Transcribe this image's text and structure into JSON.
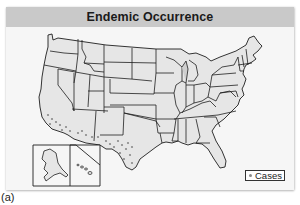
{
  "figure": {
    "title": "Endemic Occurrence",
    "caption": "(a)"
  },
  "legend": {
    "items": [
      {
        "symbol": "dot-icon",
        "label": "Cases",
        "color": "#8a8a8a"
      }
    ]
  },
  "map": {
    "region": "United States (contiguous, with Alaska and Hawaii insets)",
    "fill_color": "#e6e6e6",
    "border_color": "#1e1e1e",
    "case_dot_color": "#8a8a8a",
    "case_regions": [
      "California (southern)",
      "Arizona",
      "New Mexico",
      "Texas (western/southern)"
    ],
    "insets": [
      "Alaska",
      "Hawaii"
    ]
  },
  "colors": {
    "header_bg": "#c9c9c9",
    "panel_bg": "#f4f4f4",
    "text": "#1a1a1a"
  }
}
